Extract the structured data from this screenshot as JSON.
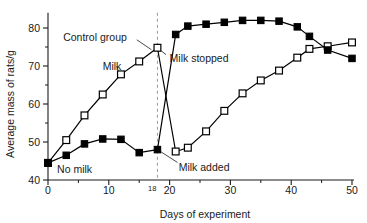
{
  "chart_data": {
    "type": "line",
    "title": "",
    "xlabel": "Days of experiment",
    "ylabel": "Average mass of rats/g",
    "xlim": [
      0,
      50
    ],
    "ylim": [
      40,
      84
    ],
    "xticks": [
      0,
      10,
      18,
      20,
      30,
      40,
      50
    ],
    "xtick_labels": [
      "0",
      "10",
      "18",
      "20",
      "30",
      "40",
      "50"
    ],
    "yticks": [
      40,
      50,
      60,
      70,
      80
    ],
    "ytick_labels": [
      "40",
      "50",
      "60",
      "70",
      "80"
    ],
    "yticks_minor": [
      45,
      55,
      65,
      75
    ],
    "grid": false,
    "legend_position": "inline-annotations",
    "vertical_marker": {
      "x": 18,
      "label": "18",
      "style": "dashed"
    },
    "series": [
      {
        "name": "Control group",
        "marker": "open-square",
        "x": [
          0,
          3,
          6,
          9,
          12,
          15,
          18,
          21,
          23,
          26,
          29,
          32,
          35,
          38,
          41,
          43,
          46,
          50
        ],
        "y": [
          44.5,
          50.5,
          57.0,
          62.5,
          67.8,
          71.2,
          74.8,
          47.5,
          48.5,
          52.8,
          58.2,
          62.8,
          66.2,
          68.8,
          72.2,
          74.5,
          75.2,
          76.2
        ]
      },
      {
        "name": "Milk",
        "marker": "filled-square",
        "x": [
          0,
          3,
          6,
          9,
          12,
          15,
          18,
          21,
          23,
          26,
          29,
          32,
          35,
          38,
          41,
          43,
          46,
          50
        ],
        "y": [
          44.5,
          46.5,
          49.5,
          50.8,
          50.7,
          47.2,
          48.0,
          78.3,
          80.5,
          81.0,
          81.5,
          82.0,
          82.0,
          81.8,
          80.3,
          77.8,
          74.2,
          72.0
        ]
      }
    ],
    "annotations": [
      {
        "id": "control-group",
        "text": "Control group",
        "x": 2.5,
        "y": 77.5
      },
      {
        "id": "milk",
        "text": "Milk",
        "x": 9.0,
        "y": 70.0
      },
      {
        "id": "milk-stopped",
        "text": "Milk stopped",
        "x": 20.0,
        "y": 72.0
      },
      {
        "id": "no-milk",
        "text": "No milk",
        "x": 1.5,
        "y": 42.8
      },
      {
        "id": "milk-added",
        "text": "Milk added",
        "x": 21.5,
        "y": 43.2
      }
    ]
  }
}
